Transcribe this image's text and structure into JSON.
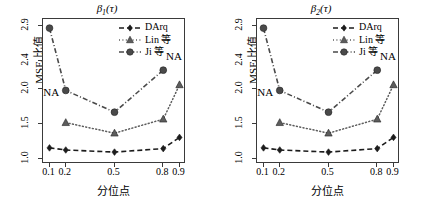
{
  "figure": {
    "width": 428,
    "height": 200,
    "background": "#ffffff"
  },
  "panels": [
    {
      "id": "beta1",
      "title_base": "β",
      "title_sub": "1",
      "title_arg": "(τ)",
      "title_full": "β1(τ)",
      "xlabel": "分位点",
      "ylabel": "MSE 比值",
      "annotations": [
        {
          "text": "NA",
          "x": 0.105,
          "y": 1.93
        },
        {
          "text": "NA",
          "x": 0.86,
          "y": 2.45
        }
      ]
    },
    {
      "id": "beta2",
      "title_base": "β",
      "title_sub": "2",
      "title_arg": "(τ)",
      "title_full": "β2(τ)",
      "xlabel": "分位点",
      "ylabel": "MSE 比值",
      "annotations": [
        {
          "text": "NA",
          "x": 0.105,
          "y": 1.93
        },
        {
          "text": "NA",
          "x": 0.86,
          "y": 2.45
        }
      ]
    }
  ],
  "legend": {
    "position": "top-right",
    "entries": [
      {
        "label": "DArq",
        "marker": "diamond",
        "line": "dashed",
        "color": "#1c1c1c"
      },
      {
        "label": "Lin 等",
        "marker": "triangle",
        "line": "dotted",
        "color": "#5d5d5d"
      },
      {
        "label": "Ji 等",
        "marker": "circle",
        "line": "dashdot",
        "color": "#4a4a4a"
      }
    ]
  },
  "chart_data": [
    {
      "type": "line",
      "title": "β1(τ)",
      "xlabel": "分位点",
      "ylabel": "MSE 比值",
      "x": [
        0.1,
        0.2,
        0.5,
        0.8,
        0.9
      ],
      "xticks": [
        "0.1",
        "0.2",
        "0.5",
        "0.8",
        "0.9"
      ],
      "yticks": [
        "1.0",
        "1.5",
        "2.0",
        "2.4",
        "2.9"
      ],
      "ytickvals": [
        1.0,
        1.5,
        2.0,
        2.4,
        2.9
      ],
      "xlim": [
        0.06,
        0.94
      ],
      "ylim": [
        0.93,
        3.0
      ],
      "grid": false,
      "legend_position": "top-right",
      "series": [
        {
          "name": "DArq",
          "values": [
            1.16,
            1.13,
            1.1,
            1.15,
            1.31
          ],
          "marker": "diamond",
          "line": "dashed",
          "color": "#1c1c1c"
        },
        {
          "name": "Lin 等",
          "values": [
            null,
            1.52,
            1.37,
            1.57,
            2.06
          ],
          "marker": "triangle",
          "line": "dotted",
          "color": "#5d5d5d"
        },
        {
          "name": "Ji 等",
          "values": [
            2.87,
            1.98,
            1.67,
            2.27,
            null
          ],
          "marker": "circle",
          "line": "dashdot",
          "color": "#4a4a4a"
        }
      ],
      "annotations": [
        {
          "text": "NA",
          "x": 0.105,
          "y": 1.93,
          "note": "Lin 等 missing at 0.1"
        },
        {
          "text": "NA",
          "x": 0.86,
          "y": 2.45,
          "note": "Ji 等 missing at 0.9"
        }
      ]
    },
    {
      "type": "line",
      "title": "β2(τ)",
      "xlabel": "分位点",
      "ylabel": "MSE 比值",
      "x": [
        0.1,
        0.2,
        0.5,
        0.8,
        0.9
      ],
      "xticks": [
        "0.1",
        "0.2",
        "0.5",
        "0.8",
        "0.9"
      ],
      "yticks": [
        "1.0",
        "1.5",
        "2.0",
        "2.4",
        "2.9"
      ],
      "ytickvals": [
        1.0,
        1.5,
        2.0,
        2.4,
        2.9
      ],
      "xlim": [
        0.06,
        0.94
      ],
      "ylim": [
        0.93,
        3.0
      ],
      "grid": false,
      "legend_position": "top-right",
      "series": [
        {
          "name": "DArq",
          "values": [
            1.16,
            1.13,
            1.1,
            1.15,
            1.31
          ],
          "marker": "diamond",
          "line": "dashed",
          "color": "#1c1c1c"
        },
        {
          "name": "Lin 等",
          "values": [
            null,
            1.52,
            1.37,
            1.57,
            2.06
          ],
          "marker": "triangle",
          "line": "dotted",
          "color": "#5d5d5d"
        },
        {
          "name": "Ji 等",
          "values": [
            2.87,
            1.98,
            1.67,
            2.27,
            null
          ],
          "marker": "circle",
          "line": "dashdot",
          "color": "#4a4a4a"
        }
      ],
      "annotations": [
        {
          "text": "NA",
          "x": 0.105,
          "y": 1.93,
          "note": "Lin 等 missing at 0.1"
        },
        {
          "text": "NA",
          "x": 0.86,
          "y": 2.45,
          "note": "Ji 等 missing at 0.9"
        }
      ]
    }
  ]
}
